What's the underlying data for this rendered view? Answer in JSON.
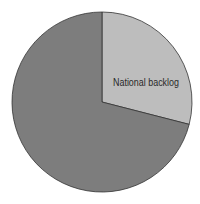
{
  "chart_data": {
    "type": "pie",
    "title": "",
    "slices": [
      {
        "label": "National backlog",
        "value": 29,
        "color": "#bdbdbd"
      },
      {
        "label": "",
        "value": 71,
        "color": "#7d7d7d"
      }
    ],
    "start_angle_deg": 0,
    "direction": "clockwise",
    "legend": "none",
    "labels_inside": true
  }
}
